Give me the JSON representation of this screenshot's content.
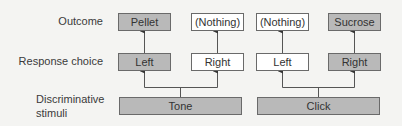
{
  "rows": {
    "outcome": "Outcome",
    "response": "Response choice",
    "stimuli_line1": "Discriminative",
    "stimuli_line2": "stimuli"
  },
  "outcomes": [
    "Pellet",
    "(Nothing)",
    "(Nothing)",
    "Sucrose"
  ],
  "responses": [
    "Left",
    "Right",
    "Left",
    "Right"
  ],
  "stimuli": [
    "Tone",
    "Click"
  ],
  "colors": {
    "shaded": "#b9b9b9",
    "unshaded": "#ffffff",
    "line": "#555555"
  }
}
